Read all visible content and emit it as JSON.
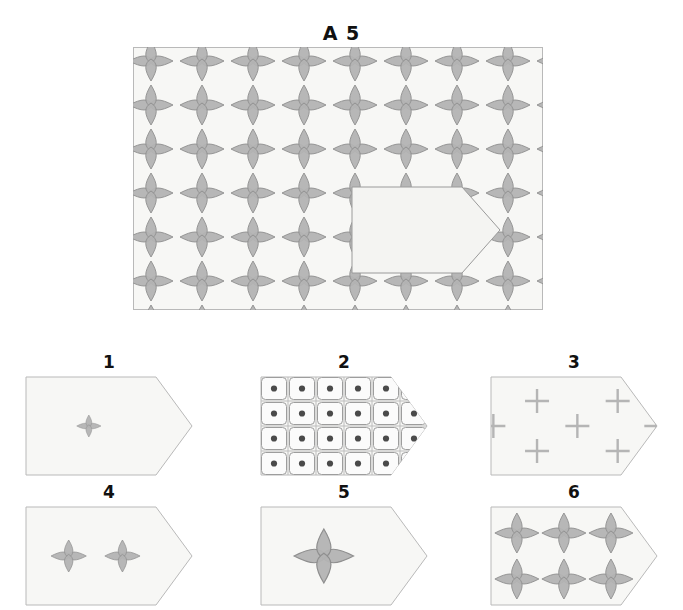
{
  "puzzle": {
    "type": "visual-pattern-completion",
    "title": "A 5",
    "main": {
      "label": "A 5",
      "panel": {
        "x": 133,
        "y": 47,
        "width": 410,
        "height": 263,
        "background": "#f7f7f5",
        "border": "#b9b9b9"
      },
      "motif": {
        "name": "four-petal-star",
        "fill": "#b3b3b3",
        "stroke": "#8f8f8f",
        "petal_half_width": 7,
        "petal_length_vertical": 20,
        "petal_length_horizontal": 22
      },
      "grid": {
        "columns": 9,
        "rows": 7,
        "spacing_x": 51,
        "spacing_y": 44
      },
      "cutout": {
        "name": "missing-piece-pentagon",
        "description": "rectangle with pointed right edge",
        "x": 352,
        "y": 187,
        "width": 148,
        "height": 86,
        "point_inset": 38,
        "fill": "#f4f4f2",
        "border": "#9a9a9a"
      }
    },
    "options": [
      {
        "id": "option-1",
        "label": "1",
        "content": "one small four-petal star centred",
        "motif_count": 1,
        "motif_scale": 0.55,
        "motifs": [
          {
            "cx": 0.38,
            "cy": 0.5,
            "scale": 0.55
          }
        ],
        "kind": "star"
      },
      {
        "id": "option-2",
        "label": "2",
        "content": "dense grid of rounded squares each with a dark centre dot",
        "kind": "dotted-grid",
        "columns": 6,
        "rows": 4,
        "dot_color": "#4a4a4a",
        "cell_color": "#fbfbfb",
        "cell_stroke": "#9d9d9d"
      },
      {
        "id": "option-3",
        "label": "3",
        "content": "seven plus/cross marks in staggered quincunx arrangement",
        "kind": "crosses",
        "cross_color": "#b5b5b5",
        "cross_count": 7
      },
      {
        "id": "option-4",
        "label": "4",
        "content": "two medium four-petal stars side by side",
        "kind": "star",
        "motif_count": 2,
        "motifs": [
          {
            "cx": 0.26,
            "cy": 0.5,
            "scale": 0.8
          },
          {
            "cx": 0.58,
            "cy": 0.5,
            "scale": 0.8
          }
        ]
      },
      {
        "id": "option-5",
        "label": "5",
        "content": "one large four-petal star",
        "kind": "star",
        "motif_count": 1,
        "motifs": [
          {
            "cx": 0.38,
            "cy": 0.5,
            "scale": 1.35
          }
        ]
      },
      {
        "id": "option-6",
        "label": "6",
        "content": "six four-petal stars in a three by two grid matching the pattern",
        "kind": "star",
        "motif_count": 6,
        "motifs": [
          {
            "cx": 0.16,
            "cy": 0.27,
            "scale": 1.0
          },
          {
            "cx": 0.44,
            "cy": 0.27,
            "scale": 1.0
          },
          {
            "cx": 0.72,
            "cy": 0.27,
            "scale": 1.0
          },
          {
            "cx": 0.16,
            "cy": 0.73,
            "scale": 1.0
          },
          {
            "cx": 0.44,
            "cy": 0.73,
            "scale": 1.0
          },
          {
            "cx": 0.72,
            "cy": 0.73,
            "scale": 1.0
          }
        ]
      }
    ],
    "colors": {
      "page_background": "#ffffff",
      "panel_background": "#f7f7f5",
      "panel_border": "#b9b9b9",
      "motif_fill": "#b3b3b3",
      "motif_stroke": "#8f8f8f",
      "label_text": "#111111",
      "cross_gray": "#b5b5b5",
      "dot_dark": "#4a4a4a"
    }
  }
}
